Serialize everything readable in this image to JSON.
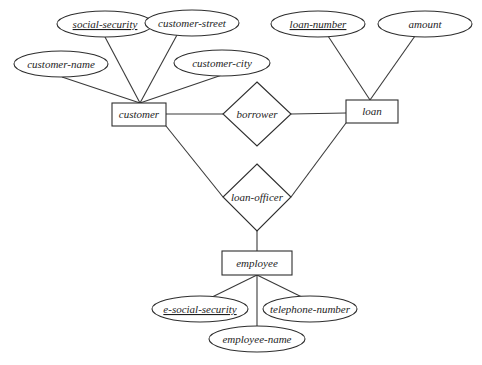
{
  "diagram": {
    "type": "ER diagram",
    "entities": [
      {
        "id": "customer",
        "label": "customer"
      },
      {
        "id": "loan",
        "label": "loan"
      },
      {
        "id": "employee",
        "label": "employee"
      }
    ],
    "relationships": [
      {
        "id": "borrower",
        "label": "borrower",
        "connects": [
          "customer",
          "loan"
        ]
      },
      {
        "id": "loan_officer",
        "label": "loan-officer",
        "connects": [
          "customer",
          "loan",
          "employee"
        ]
      }
    ],
    "attributes": {
      "social_security": {
        "label": "social-security",
        "entity": "customer",
        "key": true
      },
      "customer_street": {
        "label": "customer-street",
        "entity": "customer",
        "key": false
      },
      "customer_name": {
        "label": "customer-name",
        "entity": "customer",
        "key": false
      },
      "customer_city": {
        "label": "customer-city",
        "entity": "customer",
        "key": false
      },
      "loan_number": {
        "label": "loan-number",
        "entity": "loan",
        "key": true
      },
      "amount": {
        "label": "amount",
        "entity": "loan",
        "key": false
      },
      "e_social_security": {
        "label": "e-social-security",
        "entity": "employee",
        "key": true
      },
      "telephone_number": {
        "label": "telephone-number",
        "entity": "employee",
        "key": false
      },
      "employee_name": {
        "label": "employee-name",
        "entity": "employee",
        "key": false
      }
    }
  }
}
